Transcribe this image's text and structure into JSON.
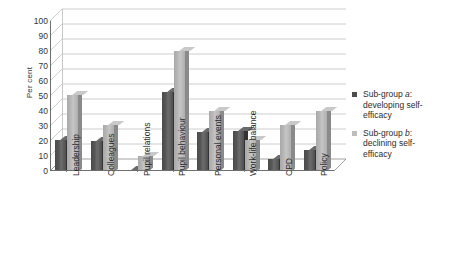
{
  "chart_data": {
    "type": "bar",
    "title": "",
    "subtitle": "",
    "xlabel": "",
    "ylabel": "Per cent",
    "ylim": [
      0,
      100
    ],
    "ytick_step": 10,
    "yticks": [
      100,
      90,
      80,
      70,
      60,
      50,
      40,
      30,
      20,
      10,
      0
    ],
    "grid": true,
    "legend_position": "right",
    "style": "3d-column",
    "categories": [
      "Leadership",
      "Colleagues",
      "Pupil relations",
      "Pupil behaviour",
      "Personal events",
      "Work-life balance",
      "CPD",
      "Policy"
    ],
    "series": [
      {
        "name": "Sub-group a: developing self-efficacy",
        "name_prefix": "Sub-group ",
        "name_italic": "a",
        "name_suffix": ": developing self-efficacy",
        "color": "#4d4d4d",
        "values": [
          21,
          20,
          1,
          53,
          26,
          27,
          8,
          14
        ]
      },
      {
        "name": "Sub-group b: declining self-efficacy",
        "name_prefix": "Sub-group ",
        "name_italic": "b",
        "name_suffix": ": declining self-efficacy",
        "color": "#bdbdbd",
        "values": [
          51,
          31,
          10,
          80,
          40,
          21,
          31,
          40
        ]
      }
    ]
  },
  "axis": {
    "y_title": "Per cent"
  },
  "legend": {
    "items": [
      {
        "swatch": "#4d4d4d",
        "line1_pre": "Sub-group ",
        "line1_italic": "a",
        "line1_post": ":",
        "line2": "developing self-",
        "line3": "efficacy"
      },
      {
        "swatch": "#bdbdbd",
        "line1_pre": "Sub-group ",
        "line1_italic": "b",
        "line1_post": ":",
        "line2": "declining self-",
        "line3": "efficacy"
      }
    ]
  }
}
